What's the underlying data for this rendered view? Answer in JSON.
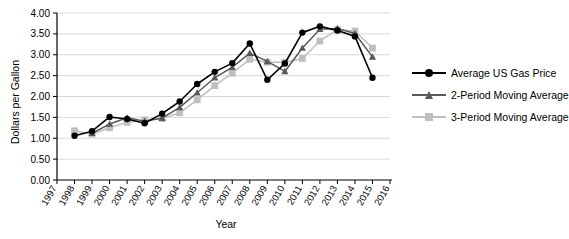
{
  "chart_data": {
    "type": "line",
    "title": "",
    "xlabel": "Year",
    "ylabel": "Dollars per Gallon",
    "x": [
      1998,
      1999,
      2000,
      2001,
      2002,
      2003,
      2004,
      2005,
      2006,
      2007,
      2008,
      2009,
      2010,
      2011,
      2012,
      2013,
      2014,
      2015
    ],
    "xlim": [
      1997,
      2016
    ],
    "ylim": [
      0.0,
      4.0
    ],
    "xticks": [
      "1997",
      "1998",
      "1999",
      "2000",
      "2001",
      "2002",
      "2003",
      "2004",
      "2005",
      "2006",
      "2007",
      "2008",
      "2009",
      "2010",
      "2011",
      "2012",
      "2013",
      "2014",
      "2015",
      "2016"
    ],
    "yticks": [
      "0.00",
      "0.50",
      "1.00",
      "1.50",
      "2.00",
      "2.50",
      "3.00",
      "3.50",
      "4.00"
    ],
    "ytick_values": [
      0.0,
      0.5,
      1.0,
      1.5,
      2.0,
      2.5,
      3.0,
      3.5,
      4.0
    ],
    "grid": "horizontal",
    "legend_position": "right",
    "series": [
      {
        "name": "Average US Gas Price",
        "color": "#000000",
        "marker": "circle",
        "x": [
          1998,
          1999,
          2000,
          2001,
          2002,
          2003,
          2004,
          2005,
          2006,
          2007,
          2008,
          2009,
          2010,
          2011,
          2012,
          2013,
          2014,
          2015
        ],
        "values": [
          1.06,
          1.17,
          1.51,
          1.46,
          1.36,
          1.59,
          1.88,
          2.3,
          2.59,
          2.8,
          3.27,
          2.4,
          2.79,
          3.53,
          3.68,
          3.58,
          3.44,
          2.45
        ]
      },
      {
        "name": "2-Period Moving Average",
        "color": "#595959",
        "marker": "triangle",
        "x": [
          1999,
          2000,
          2001,
          2002,
          2003,
          2004,
          2005,
          2006,
          2007,
          2008,
          2009,
          2010,
          2011,
          2012,
          2013,
          2014,
          2015
        ],
        "values": [
          1.12,
          1.34,
          1.49,
          1.41,
          1.48,
          1.74,
          2.09,
          2.45,
          2.7,
          3.04,
          2.84,
          2.6,
          3.16,
          3.61,
          3.63,
          3.51,
          2.95
        ]
      },
      {
        "name": "3-Period Moving Average",
        "color": "#bfbfbf",
        "marker": "square",
        "x": [
          1998,
          1999,
          2000,
          2001,
          2002,
          2003,
          2004,
          2005,
          2006,
          2007,
          2008,
          2009,
          2010,
          2011,
          2012,
          2013,
          2014,
          2015
        ],
        "values": [
          1.18,
          1.1,
          1.25,
          1.38,
          1.44,
          1.47,
          1.61,
          1.92,
          2.26,
          2.56,
          2.89,
          2.82,
          2.82,
          2.91,
          3.33,
          3.6,
          3.57,
          3.16
        ]
      }
    ]
  },
  "legend": {
    "items": [
      {
        "label": "Average US Gas Price"
      },
      {
        "label": "2-Period Moving Average"
      },
      {
        "label": "3-Period Moving Average"
      }
    ]
  }
}
